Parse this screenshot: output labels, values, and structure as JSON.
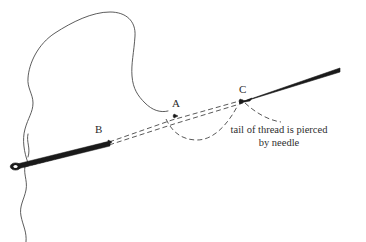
{
  "figure": {
    "background_color": "#ffffff",
    "ink_color": "#1a1a1a",
    "outline_color": "#4a4a4a",
    "thread_color": "#3a3a3a",
    "text_color": "#2b2b2b"
  },
  "labels": {
    "a": "A",
    "b": "B",
    "c": "C"
  },
  "caption": {
    "line1": "tail of thread is pierced",
    "line2": "by needle"
  },
  "elements": {
    "fabric_outline": "fabric-outline-curve",
    "needle_shaft": "needle-shaft",
    "needle_eye": "needle-eye",
    "needle_point": "needle-point",
    "thread_upper": "thread-dashed-upper",
    "thread_lower": "thread-dashed-lower",
    "thread_tail_loop": "thread-tail-loop"
  }
}
